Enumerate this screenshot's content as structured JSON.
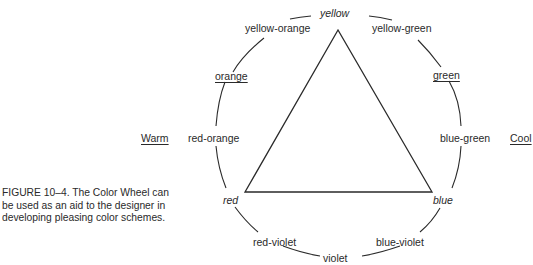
{
  "figure": {
    "caption": "FIGURE 10–4.   The Color Wheel can be used as an aid to the designer in developing pleasing color schemes."
  },
  "wheel": {
    "primary": {
      "top": "yellow",
      "left": "red",
      "right": "blue"
    },
    "secondary": {
      "orange": "orange",
      "green": "green",
      "violet": "violet"
    },
    "tertiary": {
      "yellow_orange": "yellow-orange",
      "yellow_green": "yellow-green",
      "red_orange": "red-orange",
      "blue_green": "blue-green",
      "red_violet": "red-violet",
      "blue_violet": "blue-violet"
    },
    "sides": {
      "warm": "Warm",
      "cool": "Cool"
    }
  },
  "colors": {
    "ink": "#2a2a2a",
    "background": "#ffffff"
  }
}
